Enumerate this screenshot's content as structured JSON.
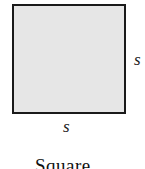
{
  "diagram": {
    "shape": "square",
    "fill_color": "#e6e6e6",
    "stroke_color": "#1a1a1a",
    "labels": {
      "right_side": "s",
      "bottom_side": "s"
    },
    "caption": "Square"
  }
}
